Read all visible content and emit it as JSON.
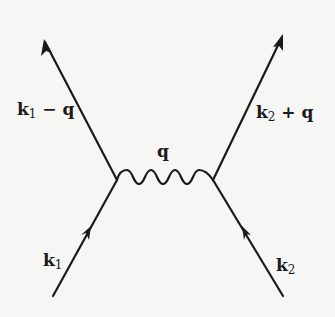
{
  "diagram": {
    "type": "feynman-diagram",
    "colors": {
      "background": "#f6f6f4",
      "stroke": "#1a1a1a"
    },
    "vertices": [
      {
        "id": "left-vertex",
        "x": 117,
        "y": 180
      },
      {
        "id": "right-vertex",
        "x": 213,
        "y": 180
      }
    ],
    "lines": [
      {
        "id": "incoming-left",
        "kind": "fermion",
        "from": [
          53,
          296
        ],
        "to": [
          117,
          180
        ],
        "label": "k1"
      },
      {
        "id": "outgoing-left",
        "kind": "fermion",
        "from": [
          117,
          180
        ],
        "to": [
          44,
          40
        ],
        "label": "k1 - q"
      },
      {
        "id": "incoming-right",
        "kind": "fermion",
        "from": [
          283,
          296
        ],
        "to": [
          213,
          180
        ],
        "label": "k2"
      },
      {
        "id": "outgoing-right",
        "kind": "fermion",
        "from": [
          213,
          180
        ],
        "to": [
          283,
          35
        ],
        "label": "k2 + q"
      },
      {
        "id": "exchange",
        "kind": "photon-wavy",
        "from": [
          117,
          180
        ],
        "to": [
          213,
          180
        ],
        "label": "q"
      }
    ],
    "labels": {
      "k1_minus_q": {
        "base": "k",
        "sub": "1",
        "rest": " − q"
      },
      "k2_plus_q": {
        "base": "k",
        "sub": "2",
        "rest": " + q"
      },
      "q": {
        "text": "q"
      },
      "k1": {
        "base": "k",
        "sub": "1"
      },
      "k2": {
        "base": "k",
        "sub": "2"
      }
    }
  }
}
